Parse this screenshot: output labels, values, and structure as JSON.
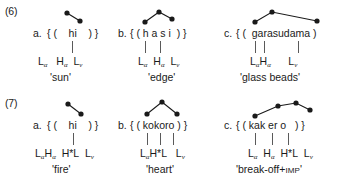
{
  "figure": {
    "domain": "linguistics-prosody-diagram",
    "ink_color": "#1a1a1a",
    "line_color": "#5a5a5a"
  },
  "examples": [
    {
      "number": "(6)",
      "items": [
        {
          "label": "a.",
          "bracket_text": "{ (    hi    ) }",
          "tier_text": "Lₐ  Hₐ  Lᵥ",
          "tier_parts": [
            {
              "base": "L",
              "sub": "α"
            },
            {
              "base": "H",
              "sub": "α"
            },
            {
              "base": "L",
              "sub": "v"
            }
          ],
          "gloss": "'sun'",
          "tone_dots": 2,
          "assoc_lines": 1
        },
        {
          "label": "b.",
          "bracket_text": "{ ( h a s i  ) }",
          "tier_text": "Lₐ  Hₐ  Lᵥ",
          "tier_parts": [
            {
              "base": "L",
              "sub": "α"
            },
            {
              "base": "H",
              "sub": "α"
            },
            {
              "base": "L",
              "sub": "v"
            }
          ],
          "gloss": "'edge'",
          "tone_dots": 2,
          "assoc_lines": 2
        },
        {
          "label": "c.",
          "bracket_text": "{ (  garasudama )",
          "tier_text": "LₐHₐ      Lᵥ",
          "tier_parts": [
            {
              "base": "L",
              "sub": "α"
            },
            {
              "base": "H",
              "sub": "α"
            },
            {
              "base": "L",
              "sub": "v"
            }
          ],
          "gloss": "'glass beads'",
          "tone_dots": 3,
          "assoc_lines": 3
        }
      ]
    },
    {
      "number": "(7)",
      "items": [
        {
          "label": "a.",
          "bracket_text": "{ (    hi    ) }",
          "tier_text": "LₐHₐ  H*L  Lᵥ",
          "tier_parts": [
            {
              "base": "L",
              "sub": "α"
            },
            {
              "base": "H",
              "sub": "α"
            },
            {
              "base": "H*L",
              "sub": ""
            },
            {
              "base": "L",
              "sub": "v"
            }
          ],
          "gloss": "'fire'",
          "tone_dots": 2,
          "assoc_lines": 1
        },
        {
          "label": "b.",
          "bracket_text": "{ ( kokoro ) }",
          "tier_text": "LₐH*L   Lᵥ",
          "tier_parts": [
            {
              "base": "L",
              "sub": "α"
            },
            {
              "base": "H*L",
              "sub": ""
            },
            {
              "base": "L",
              "sub": "v"
            }
          ],
          "gloss": "'heart'",
          "tone_dots": 3,
          "assoc_lines": 3
        },
        {
          "label": "c.",
          "bracket_text": "{ ( kak er o   ) }",
          "tier_text": "Lₐ  Hₐ  H*L  Lᵥ",
          "tier_parts": [
            {
              "base": "L",
              "sub": "α"
            },
            {
              "base": "H",
              "sub": "α"
            },
            {
              "base": "H*L",
              "sub": ""
            },
            {
              "base": "L",
              "sub": "v"
            }
          ],
          "gloss_main": "'break-off+",
          "gloss_smallcaps": "IMP",
          "gloss_end": "'",
          "gloss": "'break-off+IMP'",
          "tone_dots": 4,
          "assoc_lines": 3
        }
      ]
    }
  ]
}
